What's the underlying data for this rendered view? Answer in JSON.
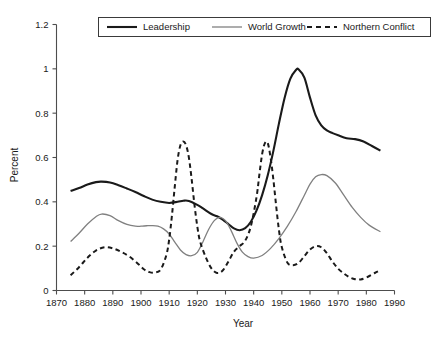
{
  "chart_data": {
    "type": "line",
    "title": "",
    "xlabel": "Year",
    "ylabel": "Percent",
    "xlim": [
      1870,
      1990
    ],
    "ylim": [
      0,
      1.2
    ],
    "grid": false,
    "legend_position": "top-center",
    "x_ticks": [
      "1870",
      "1880",
      "1890",
      "1900",
      "1910",
      "1920",
      "1930",
      "1940",
      "1950",
      "1960",
      "1970",
      "1980",
      "1990"
    ],
    "y_ticks": [
      "0",
      "0.2",
      "0.4",
      "0.6",
      "0.8",
      "1",
      "1.2"
    ],
    "series": [
      {
        "name": "Leadership",
        "color": "#1a1a1a",
        "style": "solid",
        "width": 2.1,
        "x": [
          1875,
          1878,
          1881,
          1884,
          1886,
          1889,
          1892,
          1895,
          1898,
          1901,
          1904,
          1907,
          1910,
          1913,
          1915,
          1917,
          1920,
          1922,
          1925,
          1927,
          1929,
          1931,
          1933,
          1935,
          1937,
          1939,
          1941,
          1943,
          1945,
          1947,
          1949,
          1951,
          1953,
          1955,
          1956,
          1958,
          1960,
          1962,
          1964,
          1966,
          1968,
          1970,
          1973,
          1976,
          1979,
          1982,
          1985
        ],
        "y": [
          0.449,
          0.462,
          0.478,
          0.489,
          0.491,
          0.487,
          0.475,
          0.46,
          0.444,
          0.426,
          0.41,
          0.4,
          0.395,
          0.4,
          0.405,
          0.404,
          0.386,
          0.37,
          0.345,
          0.335,
          0.32,
          0.3,
          0.28,
          0.272,
          0.281,
          0.31,
          0.36,
          0.43,
          0.52,
          0.63,
          0.755,
          0.87,
          0.955,
          0.995,
          0.997,
          0.96,
          0.87,
          0.79,
          0.745,
          0.722,
          0.71,
          0.7,
          0.687,
          0.683,
          0.672,
          0.652,
          0.631
        ]
      },
      {
        "name": "World Growth",
        "color": "#808080",
        "style": "solid",
        "width": 1.3,
        "x": [
          1875,
          1878,
          1881,
          1884,
          1886,
          1889,
          1892,
          1895,
          1898,
          1900,
          1902,
          1904,
          1906,
          1908,
          1910,
          1912,
          1914,
          1916,
          1918,
          1920,
          1922,
          1924,
          1926,
          1928,
          1930,
          1932,
          1934,
          1936,
          1938,
          1940,
          1943,
          1946,
          1949,
          1952,
          1955,
          1958,
          1960,
          1962,
          1964,
          1966,
          1969,
          1972,
          1975,
          1978,
          1981,
          1985
        ],
        "y": [
          0.221,
          0.258,
          0.3,
          0.333,
          0.345,
          0.338,
          0.315,
          0.298,
          0.29,
          0.29,
          0.292,
          0.293,
          0.29,
          0.278,
          0.255,
          0.218,
          0.183,
          0.162,
          0.157,
          0.172,
          0.22,
          0.275,
          0.315,
          0.33,
          0.315,
          0.27,
          0.215,
          0.173,
          0.153,
          0.146,
          0.158,
          0.19,
          0.235,
          0.29,
          0.355,
          0.43,
          0.48,
          0.513,
          0.523,
          0.518,
          0.485,
          0.43,
          0.375,
          0.33,
          0.295,
          0.265
        ]
      },
      {
        "name": "Northern Conflict",
        "color": "#1a1a1a",
        "style": "dashed",
        "width": 2.0,
        "x": [
          1875,
          1878,
          1881,
          1884,
          1887,
          1890,
          1893,
          1896,
          1899,
          1901,
          1903,
          1905,
          1907,
          1909,
          1910,
          1911,
          1912,
          1913,
          1914,
          1915,
          1916,
          1917,
          1918,
          1919,
          1920,
          1921,
          1923,
          1925,
          1927,
          1929,
          1931,
          1933,
          1935,
          1937,
          1939,
          1941,
          1942,
          1943,
          1944,
          1945,
          1946,
          1947,
          1948,
          1949,
          1950,
          1952,
          1954,
          1956,
          1958,
          1960,
          1962,
          1964,
          1966,
          1968,
          1970,
          1972,
          1974,
          1976,
          1978,
          1980,
          1983,
          1985
        ],
        "y": [
          0.069,
          0.105,
          0.148,
          0.18,
          0.195,
          0.19,
          0.174,
          0.152,
          0.12,
          0.096,
          0.083,
          0.081,
          0.095,
          0.16,
          0.23,
          0.34,
          0.47,
          0.59,
          0.655,
          0.672,
          0.655,
          0.6,
          0.5,
          0.385,
          0.288,
          0.22,
          0.15,
          0.1,
          0.079,
          0.09,
          0.13,
          0.175,
          0.2,
          0.225,
          0.29,
          0.42,
          0.52,
          0.615,
          0.665,
          0.665,
          0.6,
          0.5,
          0.38,
          0.27,
          0.195,
          0.125,
          0.114,
          0.125,
          0.155,
          0.185,
          0.2,
          0.195,
          0.168,
          0.13,
          0.098,
          0.077,
          0.06,
          0.051,
          0.05,
          0.058,
          0.079,
          0.091
        ]
      }
    ]
  },
  "legend": {
    "items": [
      {
        "label": "Leadership"
      },
      {
        "label": "World Growth"
      },
      {
        "label": "Northern Conflict"
      }
    ]
  },
  "axes": {
    "y_title": "Percent",
    "x_title": "Year"
  }
}
